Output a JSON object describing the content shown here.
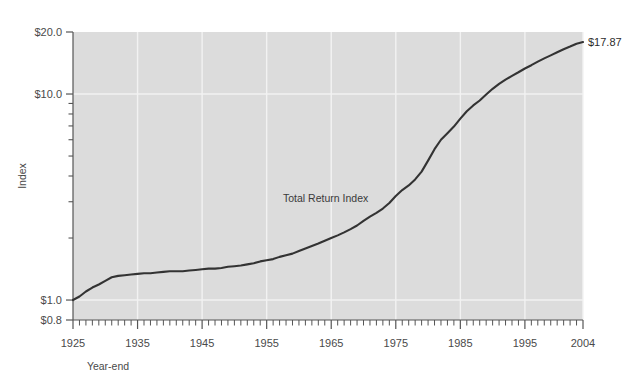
{
  "chart_data": {
    "type": "line",
    "title": "",
    "xlabel": "Year-end",
    "ylabel": "Index",
    "yscale": "log",
    "ylim": [
      0.8,
      20.0
    ],
    "xlim": [
      1925,
      2004
    ],
    "grid": true,
    "legend": "none",
    "ytick_labels": [
      "$20.0",
      "$10.0",
      "$1.0",
      "$0.8"
    ],
    "ytick_values": [
      20.0,
      10.0,
      1.0,
      0.8
    ],
    "yminor_values": [
      9,
      8,
      7,
      6,
      5,
      4,
      3,
      2
    ],
    "xtick_labels": [
      "1925",
      "1935",
      "1945",
      "1955",
      "1965",
      "1975",
      "1985",
      "1995",
      "2004"
    ],
    "xtick_values": [
      1925,
      1935,
      1945,
      1955,
      1965,
      1975,
      1985,
      1995,
      2004
    ],
    "series": [
      {
        "name": "Total Return Index",
        "annotation": "Total Return Index",
        "color": "#333333",
        "end_label": "$17.87",
        "end_value": 17.87,
        "x": [
          1925,
          1926,
          1927,
          1928,
          1929,
          1930,
          1931,
          1932,
          1933,
          1934,
          1935,
          1936,
          1937,
          1938,
          1939,
          1940,
          1941,
          1942,
          1943,
          1944,
          1945,
          1946,
          1947,
          1948,
          1949,
          1950,
          1951,
          1952,
          1953,
          1954,
          1955,
          1956,
          1957,
          1958,
          1959,
          1960,
          1961,
          1962,
          1963,
          1964,
          1965,
          1966,
          1967,
          1968,
          1969,
          1970,
          1971,
          1972,
          1973,
          1974,
          1975,
          1976,
          1977,
          1978,
          1979,
          1980,
          1981,
          1982,
          1983,
          1984,
          1985,
          1986,
          1987,
          1988,
          1989,
          1990,
          1991,
          1992,
          1993,
          1994,
          1995,
          1996,
          1997,
          1998,
          1999,
          2000,
          2001,
          2002,
          2003,
          2004
        ],
        "y": [
          1.0,
          1.04,
          1.1,
          1.15,
          1.19,
          1.24,
          1.29,
          1.31,
          1.32,
          1.33,
          1.34,
          1.35,
          1.35,
          1.36,
          1.37,
          1.38,
          1.38,
          1.38,
          1.39,
          1.4,
          1.41,
          1.42,
          1.42,
          1.43,
          1.45,
          1.46,
          1.47,
          1.49,
          1.51,
          1.54,
          1.56,
          1.58,
          1.62,
          1.65,
          1.68,
          1.73,
          1.78,
          1.83,
          1.88,
          1.94,
          2.0,
          2.06,
          2.13,
          2.21,
          2.3,
          2.42,
          2.54,
          2.65,
          2.78,
          2.96,
          3.2,
          3.42,
          3.6,
          3.85,
          4.2,
          4.75,
          5.4,
          6.0,
          6.45,
          6.95,
          7.6,
          8.25,
          8.8,
          9.3,
          9.95,
          10.6,
          11.2,
          11.75,
          12.25,
          12.75,
          13.3,
          13.8,
          14.35,
          14.9,
          15.4,
          15.95,
          16.5,
          17.0,
          17.55,
          17.87
        ]
      }
    ]
  },
  "figure": {
    "plot_bg_color": "#dcdcdc",
    "grid_color": "#f2f2f2",
    "axis_color": "#555555"
  }
}
